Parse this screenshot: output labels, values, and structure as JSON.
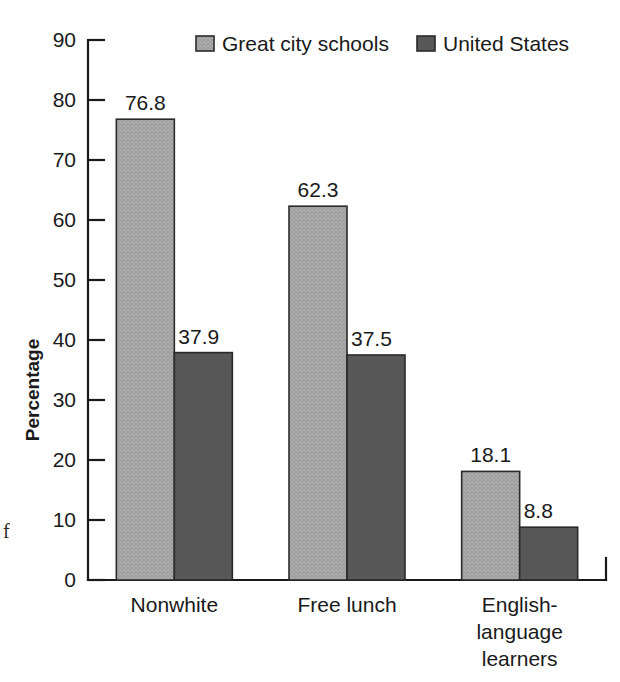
{
  "chart_data": {
    "type": "bar",
    "title": "",
    "subtitle": "",
    "xlabel": "",
    "ylabel": "Percentage",
    "ylim": [
      0,
      90
    ],
    "ytick_step": 10,
    "yticks": [
      "0",
      "10",
      "20",
      "30",
      "40",
      "50",
      "60",
      "70",
      "80",
      "90"
    ],
    "grid": false,
    "legend_position": "top-center",
    "categories": [
      "Nonwhite",
      "Free lunch",
      "English-language learners"
    ],
    "category_lines": [
      [
        "Nonwhite"
      ],
      [
        "Free lunch"
      ],
      [
        "English-",
        "language",
        "learners"
      ]
    ],
    "series": [
      {
        "name": "Great city schools",
        "color": "#ababab",
        "pattern": "crosshatch",
        "values": [
          76.8,
          62.3,
          18.1
        ],
        "value_labels": [
          "76.8",
          "62.3",
          "18.1"
        ]
      },
      {
        "name": "United States",
        "color": "#585858",
        "pattern": "solid",
        "values": [
          37.9,
          37.5,
          8.8
        ],
        "value_labels": [
          "37.9",
          "37.5",
          "8.8"
        ]
      }
    ]
  },
  "legend": {
    "items": [
      {
        "label": "Great city schools",
        "color": "#ababab"
      },
      {
        "label": "United States",
        "color": "#585858"
      }
    ]
  },
  "page": {
    "margin_text_fragment": "f"
  },
  "colors": {
    "series_light": "#ababab",
    "series_dark": "#585858",
    "axis": "#1a1a1a",
    "text": "#1a1a1a",
    "background": "#ffffff"
  }
}
